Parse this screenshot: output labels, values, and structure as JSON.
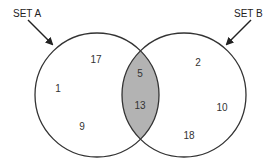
{
  "diagram": {
    "type": "venn",
    "colors": {
      "outline": "#333333",
      "intersection_fill": "#b3b3b3",
      "background": "#ffffff"
    },
    "sets": [
      {
        "label": "SET A",
        "only_values": [
          "17",
          "1",
          "9"
        ]
      },
      {
        "label": "SET B",
        "only_values": [
          "2",
          "10",
          "18"
        ]
      }
    ],
    "intersection_values": [
      "5",
      "13"
    ]
  }
}
